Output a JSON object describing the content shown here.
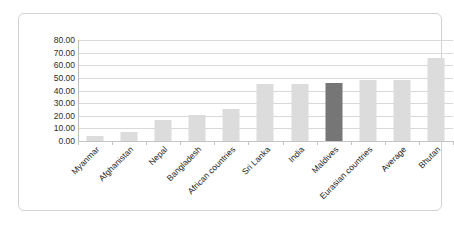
{
  "chart_data": {
    "type": "bar",
    "title": "",
    "xlabel": "",
    "ylabel": "",
    "ylim": [
      0,
      80
    ],
    "ytick_step": 10,
    "grid": true,
    "legend": "none",
    "ytick_labels": [
      "0.00",
      "10.00",
      "20.00",
      "30.00",
      "40.00",
      "50.00",
      "60.00",
      "70.00",
      "80.00"
    ],
    "categories": [
      "Myanmar",
      "Afghanistan",
      "Nepal",
      "Bangladesh",
      "African countries",
      "Sri Lanka",
      "India",
      "Maldives",
      "Eurasian countries",
      "Average",
      "Bhutan"
    ],
    "values": [
      4.0,
      7.0,
      17.0,
      21.0,
      25.0,
      45.0,
      45.0,
      46.0,
      48.0,
      48.0,
      66.0
    ],
    "highlight_index": 7,
    "colors": {
      "bar": "#dcdcdc",
      "bar_highlight": "#767676",
      "gridline": "#d9d9d9",
      "axis": "#bdbdbd",
      "frame_border": "#d2d2d2",
      "text": "#222222",
      "background": "#ffffff"
    }
  }
}
